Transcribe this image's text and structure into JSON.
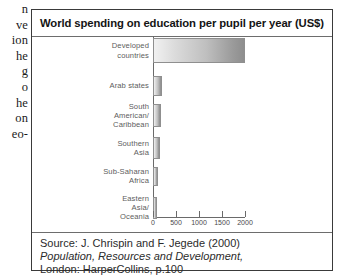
{
  "page_margin_text": {
    "lines": [
      "n",
      "ve",
      "ion",
      "he",
      "g",
      "o",
      "he",
      "on",
      "eo-"
    ]
  },
  "figure": {
    "title": "World spending on education per pupil per year (US$)",
    "source": {
      "line1": "Source: J. Chrispin and F. Jegede (2000)",
      "line2": "Population, Resources and Development,",
      "line3": "London: HarperCollins, p.100"
    }
  },
  "chart_data": {
    "type": "bar",
    "orientation": "horizontal",
    "title": "World spending on education per pupil per year (US$)",
    "xlabel": "",
    "ylabel": "",
    "xlim": [
      0,
      2000
    ],
    "xticks": [
      0,
      500,
      1000,
      1500,
      2000
    ],
    "xtick_labels": [
      "0",
      "500",
      "1000",
      "1500",
      "2000"
    ],
    "grid": false,
    "legend": null,
    "units": "US$ per pupil per year",
    "categories": [
      "Developed countries",
      "Arab states",
      "South American/ Caribbean",
      "Southern Asia",
      "Sub-Saharan Africa",
      "Eastern Asia/ Oceania"
    ],
    "category_lines": [
      [
        "Developed",
        "countries"
      ],
      [
        "Arab states"
      ],
      [
        "South",
        "American/",
        "Caribbean"
      ],
      [
        "Southern",
        "Asia"
      ],
      [
        "Sub-Saharan",
        "Africa"
      ],
      [
        "Eastern",
        "Asia/",
        "Oceania"
      ]
    ],
    "values": [
      2000,
      190,
      180,
      150,
      100,
      95
    ],
    "bar_fill": "#c4c4c4",
    "bar_edge": "#8f8f8f"
  }
}
